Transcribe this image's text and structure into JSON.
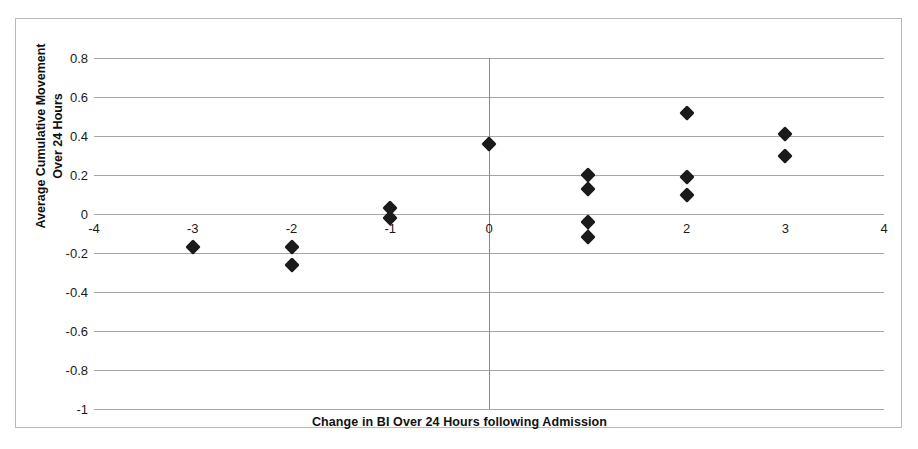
{
  "chart_data": {
    "type": "scatter",
    "title": "",
    "xlabel": "Change in BI Over 24 Hours following Admission",
    "ylabel_line1": "Average Cumulative Movement",
    "ylabel_line2": "Over 24 Hours",
    "xlim": [
      -4,
      4
    ],
    "ylim": [
      -1,
      0.8
    ],
    "xticks": [
      -4,
      -3,
      -2,
      -1,
      0,
      1,
      2,
      3,
      4
    ],
    "xtick_labels": [
      "-4",
      "-3",
      "-2",
      "-1",
      "0",
      "1",
      "2",
      "3",
      "4"
    ],
    "yticks": [
      0.8,
      0.6,
      0.4,
      0.2,
      0,
      -0.2,
      -0.4,
      -0.6,
      -0.8,
      -1
    ],
    "ytick_labels": [
      "0.8",
      "0.6",
      "0.4",
      "0.2",
      "0",
      "-0.2",
      "-0.4",
      "-0.6",
      "-0.8",
      "-1"
    ],
    "grid": "horizontal",
    "legend": "none",
    "marker": "diamond",
    "marker_color": "#1a1a1a",
    "gridline_color": "#a6a6a6",
    "axis_color": "#8a8a8a",
    "background": "#ffffff",
    "points": [
      {
        "x": -3,
        "y": -0.17
      },
      {
        "x": -2,
        "y": -0.17
      },
      {
        "x": -2,
        "y": -0.26
      },
      {
        "x": -1,
        "y": 0.03
      },
      {
        "x": -1,
        "y": -0.02
      },
      {
        "x": 0,
        "y": 0.36
      },
      {
        "x": 1,
        "y": 0.2
      },
      {
        "x": 1,
        "y": 0.13
      },
      {
        "x": 1,
        "y": -0.04
      },
      {
        "x": 1,
        "y": -0.12
      },
      {
        "x": 2,
        "y": 0.52
      },
      {
        "x": 2,
        "y": 0.19
      },
      {
        "x": 2,
        "y": 0.1
      },
      {
        "x": 3,
        "y": 0.41
      },
      {
        "x": 3,
        "y": 0.3
      }
    ]
  }
}
